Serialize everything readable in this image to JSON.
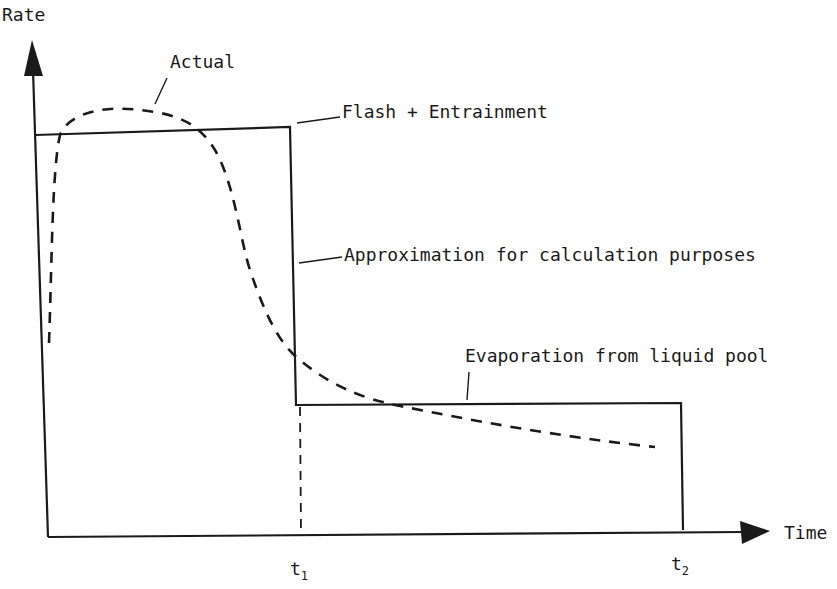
{
  "diagram": {
    "axes": {
      "y_label": "Rate",
      "x_label": "Time"
    },
    "ticks": {
      "t1": {
        "base": "t",
        "sub": "1"
      },
      "t2": {
        "base": "t",
        "sub": "2"
      }
    },
    "annotations": {
      "actual": "Actual",
      "flash": "Flash + Entrainment",
      "approximation": "Approximation for calculation purposes",
      "evaporation": "Evaporation from liquid pool"
    },
    "series": [
      {
        "name": "Actual",
        "style": "dashed",
        "description": "Rapid rise to peak then decay to low tail"
      },
      {
        "name": "Approximation for calculation purposes",
        "style": "solid step",
        "phases": [
          "Flash + Entrainment (0 to t1)",
          "Evaporation from liquid pool (t1 to t2)"
        ]
      }
    ],
    "colors": {
      "ink": "#1a1a1a",
      "background": "#ffffff"
    }
  }
}
